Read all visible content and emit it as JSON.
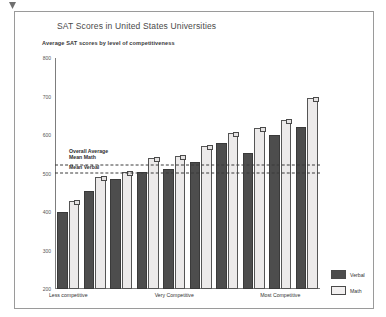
{
  "figure": {
    "title": "SAT Scores in United States Universities",
    "subtitle": "Average SAT scores by level of competitiveness"
  },
  "legend": {
    "position": "bottom-right",
    "items": [
      {
        "label": "Verbal",
        "color": "#4d4d4d"
      },
      {
        "label": "Math",
        "color": "#f2f0f0"
      }
    ]
  },
  "reference_lines": [
    {
      "label_line1": "Overall Average",
      "label_line2": "Mean Math",
      "value": 523
    },
    {
      "label_line1": "Mean Verbal",
      "label_line2": "",
      "value": 501
    }
  ],
  "chart_data": {
    "type": "bar",
    "title": "SAT Scores in United States Universities",
    "subtitle": "Average SAT scores by level of competitiveness",
    "xlabel": "",
    "ylabel": "",
    "ylim": [
      200,
      800
    ],
    "yticks": [
      200,
      300,
      400,
      500,
      600,
      700,
      800
    ],
    "grid": false,
    "legend_position": "bottom-right",
    "category_axis_labels": [
      "Less competitive",
      "Very Competitive",
      "Most Competitive"
    ],
    "category_axis_label_positions": [
      0.5,
      4.5,
      8.5
    ],
    "categories": [
      "1",
      "2",
      "3",
      "4",
      "5",
      "6",
      "7",
      "8",
      "9",
      "10"
    ],
    "series": [
      {
        "name": "Verbal",
        "color": "#4d4d4d",
        "values": [
          400,
          455,
          485,
          505,
          512,
          530,
          578,
          552,
          600,
          622
        ]
      },
      {
        "name": "Math",
        "color": "#f2f0f0",
        "values": [
          428,
          492,
          505,
          540,
          545,
          572,
          605,
          618,
          638,
          697
        ]
      }
    ],
    "annotations": [
      {
        "text": "Overall Average",
        "y": 523
      },
      {
        "text": "Mean Math",
        "y": 523
      },
      {
        "text": "Mean Verbal",
        "y": 501
      }
    ]
  }
}
